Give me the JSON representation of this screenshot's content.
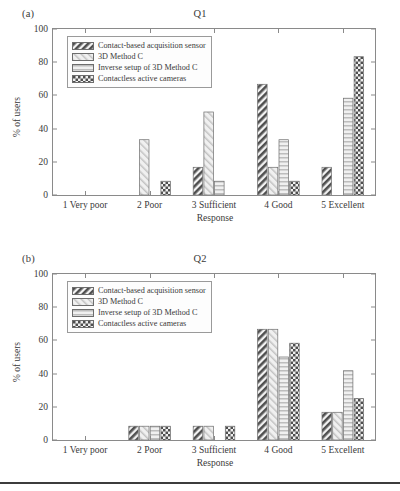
{
  "figure": {
    "bottom_rule": true
  },
  "series_styles": {
    "contact": "#4a4a4a",
    "method_c": "#d6d6d6",
    "inverse": "#c9c9c9",
    "contactless": "#4a4a4a"
  },
  "panels": [
    {
      "tag": "(a)",
      "title": "Q1",
      "ylabel": "% of users",
      "xlabel": "Response",
      "yticks": [
        0,
        20,
        40,
        60,
        80,
        100
      ],
      "categories": [
        "1 Very poor",
        "2 Poor",
        "3 Sufficient",
        "4 Good",
        "5 Excellent"
      ],
      "legend": [
        "Contact-based acquisition sensor",
        "3D Method C",
        "Inverse setup of 3D Method C",
        "Contactless active cameras"
      ],
      "series": [
        {
          "name": "Contact-based acquisition sensor",
          "pattern": "diag-dark",
          "values": [
            0,
            0,
            16.7,
            66.7,
            16.7
          ]
        },
        {
          "name": "3D Method C",
          "pattern": "diag-light",
          "values": [
            0,
            33.3,
            50,
            16.7,
            0
          ]
        },
        {
          "name": "Inverse setup of 3D Method C",
          "pattern": "horiz-light",
          "values": [
            0,
            0,
            8.3,
            33.3,
            58.3
          ]
        },
        {
          "name": "Contactless active cameras",
          "pattern": "check-dark",
          "values": [
            0,
            8.3,
            0,
            8.3,
            83.3
          ]
        }
      ]
    },
    {
      "tag": "(b)",
      "title": "Q2",
      "ylabel": "% of users",
      "xlabel": "Response",
      "yticks": [
        0,
        20,
        40,
        60,
        80,
        100
      ],
      "categories": [
        "1 Very poor",
        "2 Poor",
        "3 Sufficient",
        "4 Good",
        "5 Excellent"
      ],
      "legend": [
        "Contact-based acquisition sensor",
        "3D Method C",
        "Inverse setup of 3D Method C",
        "Contactless active cameras"
      ],
      "series": [
        {
          "name": "Contact-based acquisition sensor",
          "pattern": "diag-dark",
          "values": [
            0,
            8.3,
            8.3,
            66.7,
            16.7
          ]
        },
        {
          "name": "3D Method C",
          "pattern": "diag-light",
          "values": [
            0,
            8.3,
            8.3,
            66.7,
            16.7
          ]
        },
        {
          "name": "Inverse setup of 3D Method C",
          "pattern": "horiz-light",
          "values": [
            0,
            8.3,
            0,
            50,
            41.7
          ]
        },
        {
          "name": "Contactless active cameras",
          "pattern": "check-dark",
          "values": [
            0,
            8.3,
            8.3,
            58.3,
            25
          ]
        }
      ]
    }
  ],
  "chart_data": [
    {
      "type": "bar",
      "title": "Q1",
      "panel": "(a)",
      "xlabel": "Response",
      "ylabel": "% of users",
      "ylim": [
        0,
        100
      ],
      "yticks": [
        0,
        20,
        40,
        60,
        80,
        100
      ],
      "grid": false,
      "legend_position": "upper-left-inside",
      "categories": [
        "1 Very poor",
        "2 Poor",
        "3 Sufficient",
        "4 Good",
        "5 Excellent"
      ],
      "series": [
        {
          "name": "Contact-based acquisition sensor",
          "values": [
            0,
            0,
            16.7,
            66.7,
            16.7
          ]
        },
        {
          "name": "3D Method C",
          "values": [
            0,
            33.3,
            50,
            16.7,
            0
          ]
        },
        {
          "name": "Inverse setup of 3D Method C",
          "values": [
            0,
            0,
            8.3,
            33.3,
            58.3
          ]
        },
        {
          "name": "Contactless active cameras",
          "values": [
            0,
            8.3,
            0,
            8.3,
            83.3
          ]
        }
      ]
    },
    {
      "type": "bar",
      "title": "Q2",
      "panel": "(b)",
      "xlabel": "Response",
      "ylabel": "% of users",
      "ylim": [
        0,
        100
      ],
      "yticks": [
        0,
        20,
        40,
        60,
        80,
        100
      ],
      "grid": false,
      "legend_position": "upper-left-inside",
      "categories": [
        "1 Very poor",
        "2 Poor",
        "3 Sufficient",
        "4 Good",
        "5 Excellent"
      ],
      "series": [
        {
          "name": "Contact-based acquisition sensor",
          "values": [
            0,
            8.3,
            8.3,
            66.7,
            16.7
          ]
        },
        {
          "name": "3D Method C",
          "values": [
            0,
            8.3,
            8.3,
            66.7,
            16.7
          ]
        },
        {
          "name": "Inverse setup of 3D Method C",
          "values": [
            0,
            8.3,
            0,
            50,
            41.7
          ]
        },
        {
          "name": "Contactless active cameras",
          "values": [
            0,
            8.3,
            8.3,
            58.3,
            25
          ]
        }
      ]
    }
  ]
}
